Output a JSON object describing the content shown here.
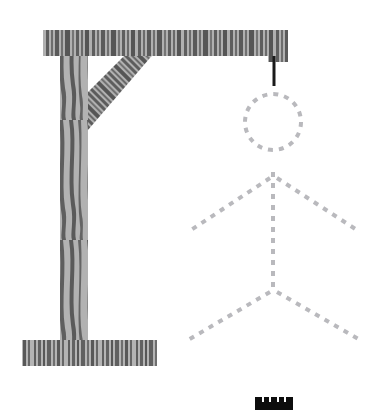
{
  "app": {
    "title": "Hangman",
    "canvas": {
      "width": 381,
      "height": 410,
      "background": "#ffffff"
    }
  },
  "colors": {
    "wood_light": "#b8b8b8",
    "wood_dark": "#5e5e5e",
    "wood_mid": "#8f8f8f",
    "rope": "#1a1a1a",
    "figure_dash": "#b9b9bd",
    "word_bar": "#0d0d0d",
    "word_gap": "#ffffff",
    "background": "#ffffff"
  },
  "gallows": {
    "label": "gallows",
    "parts": [
      {
        "name": "top-beam",
        "x": 43,
        "y": 30,
        "width": 245,
        "height": 26
      },
      {
        "name": "vertical-post",
        "x": 60,
        "y": 30,
        "width": 28,
        "height": 318
      },
      {
        "name": "diagonal-brace",
        "points": "88,48 88,128 160,48"
      },
      {
        "name": "base-plank",
        "x": 22,
        "y": 340,
        "width": 135,
        "height": 26
      }
    ]
  },
  "rope": {
    "name": "rope",
    "x1": 274,
    "y1": 56,
    "x2": 274,
    "y2": 86,
    "stroke_width": 3
  },
  "figure": {
    "label": "hangman-stick-figure",
    "style": "dashed",
    "dash_pattern": "5 6",
    "stroke_width": 4,
    "head": {
      "cx": 273,
      "cy": 122,
      "r": 28
    },
    "body": {
      "x1": 273,
      "y1": 172,
      "x2": 273,
      "y2": 292
    },
    "left_arm": {
      "x1": 270,
      "y1": 178,
      "x2": 188,
      "y2": 232
    },
    "right_arm": {
      "x1": 277,
      "y1": 178,
      "x2": 360,
      "y2": 232
    },
    "left_leg": {
      "x1": 270,
      "y1": 292,
      "x2": 188,
      "y2": 340
    },
    "right_leg": {
      "x1": 277,
      "y1": 292,
      "x2": 360,
      "y2": 340
    }
  },
  "word_display": {
    "name": "word-blanks",
    "x": 255,
    "y": 397,
    "width": 38,
    "height": 13,
    "letter_slots": 5,
    "revealed_letters": [
      "",
      "",
      "",
      "",
      ""
    ]
  },
  "wood_grain": {
    "beam_stripes": [
      {
        "x": 44,
        "w": 3,
        "c": "#5e5e5e"
      },
      {
        "x": 48,
        "w": 2,
        "c": "#9a9a9a"
      },
      {
        "x": 51,
        "w": 5,
        "c": "#5e5e5e"
      },
      {
        "x": 57,
        "w": 3,
        "c": "#b0b0b0"
      },
      {
        "x": 61,
        "w": 2,
        "c": "#5e5e5e"
      },
      {
        "x": 64,
        "w": 4,
        "c": "#a8a8a8"
      },
      {
        "x": 69,
        "w": 6,
        "c": "#5e5e5e"
      },
      {
        "x": 76,
        "w": 3,
        "c": "#b4b4b4"
      },
      {
        "x": 80,
        "w": 2,
        "c": "#5e5e5e"
      },
      {
        "x": 83,
        "w": 5,
        "c": "#a0a0a0"
      },
      {
        "x": 89,
        "w": 3,
        "c": "#5e5e5e"
      },
      {
        "x": 93,
        "w": 7,
        "c": "#b0b0b0"
      },
      {
        "x": 101,
        "w": 2,
        "c": "#5e5e5e"
      },
      {
        "x": 104,
        "w": 3,
        "c": "#9c9c9c"
      },
      {
        "x": 108,
        "w": 4,
        "c": "#5e5e5e"
      },
      {
        "x": 113,
        "w": 2,
        "c": "#b8b8b8"
      },
      {
        "x": 116,
        "w": 3,
        "c": "#5e5e5e"
      },
      {
        "x": 120,
        "w": 5,
        "c": "#a6a6a6"
      },
      {
        "x": 126,
        "w": 2,
        "c": "#5e5e5e"
      },
      {
        "x": 129,
        "w": 4,
        "c": "#b2b2b2"
      },
      {
        "x": 134,
        "w": 3,
        "c": "#5e5e5e"
      },
      {
        "x": 138,
        "w": 6,
        "c": "#9e9e9e"
      },
      {
        "x": 145,
        "w": 2,
        "c": "#5e5e5e"
      },
      {
        "x": 148,
        "w": 3,
        "c": "#b6b6b6"
      },
      {
        "x": 152,
        "w": 5,
        "c": "#5e5e5e"
      },
      {
        "x": 158,
        "w": 3,
        "c": "#a4a4a4"
      },
      {
        "x": 162,
        "w": 2,
        "c": "#5e5e5e"
      },
      {
        "x": 165,
        "w": 4,
        "c": "#b0b0b0"
      },
      {
        "x": 170,
        "w": 3,
        "c": "#5e5e5e"
      },
      {
        "x": 174,
        "w": 2,
        "c": "#9a9a9a"
      },
      {
        "x": 177,
        "w": 6,
        "c": "#5e5e5e"
      },
      {
        "x": 184,
        "w": 3,
        "c": "#b4b4b4"
      },
      {
        "x": 188,
        "w": 2,
        "c": "#5e5e5e"
      },
      {
        "x": 191,
        "w": 5,
        "c": "#a2a2a2"
      },
      {
        "x": 197,
        "w": 3,
        "c": "#5e5e5e"
      },
      {
        "x": 201,
        "w": 4,
        "c": "#b6b6b6"
      },
      {
        "x": 206,
        "w": 2,
        "c": "#5e5e5e"
      },
      {
        "x": 209,
        "w": 3,
        "c": "#9e9e9e"
      },
      {
        "x": 213,
        "w": 5,
        "c": "#5e5e5e"
      },
      {
        "x": 219,
        "w": 2,
        "c": "#b2b2b2"
      },
      {
        "x": 222,
        "w": 4,
        "c": "#5e5e5e"
      },
      {
        "x": 227,
        "w": 3,
        "c": "#a8a8a8"
      },
      {
        "x": 231,
        "w": 2,
        "c": "#5e5e5e"
      },
      {
        "x": 234,
        "w": 5,
        "c": "#b0b0b0"
      },
      {
        "x": 240,
        "w": 3,
        "c": "#5e5e5e"
      },
      {
        "x": 244,
        "w": 2,
        "c": "#9c9c9c"
      },
      {
        "x": 247,
        "w": 6,
        "c": "#5e5e5e"
      },
      {
        "x": 254,
        "w": 3,
        "c": "#b4b4b4"
      },
      {
        "x": 258,
        "w": 2,
        "c": "#5e5e5e"
      },
      {
        "x": 261,
        "w": 4,
        "c": "#a6a6a6"
      },
      {
        "x": 266,
        "w": 3,
        "c": "#5e5e5e"
      },
      {
        "x": 270,
        "w": 5,
        "c": "#b0b0b0"
      },
      {
        "x": 276,
        "w": 3,
        "c": "#5e5e5e"
      },
      {
        "x": 280,
        "w": 2,
        "c": "#9e9e9e"
      },
      {
        "x": 283,
        "w": 5,
        "c": "#5e5e5e"
      }
    ],
    "base_stripes": [
      {
        "x": 23,
        "w": 2,
        "c": "#5e5e5e"
      },
      {
        "x": 26,
        "w": 3,
        "c": "#a8a8a8"
      },
      {
        "x": 30,
        "w": 2,
        "c": "#5e5e5e"
      },
      {
        "x": 33,
        "w": 2,
        "c": "#b4b4b4"
      },
      {
        "x": 36,
        "w": 2,
        "c": "#5e5e5e"
      },
      {
        "x": 39,
        "w": 4,
        "c": "#a0a0a0"
      },
      {
        "x": 44,
        "w": 2,
        "c": "#5e5e5e"
      },
      {
        "x": 47,
        "w": 6,
        "c": "#b6b6b6"
      },
      {
        "x": 54,
        "w": 2,
        "c": "#5e5e5e"
      },
      {
        "x": 57,
        "w": 2,
        "c": "#9e9e9e"
      },
      {
        "x": 60,
        "w": 3,
        "c": "#5e5e5e"
      },
      {
        "x": 64,
        "w": 2,
        "c": "#b2b2b2"
      },
      {
        "x": 67,
        "w": 5,
        "c": "#5e5e5e"
      },
      {
        "x": 73,
        "w": 3,
        "c": "#a6a6a6"
      },
      {
        "x": 77,
        "w": 3,
        "c": "#5e5e5e"
      },
      {
        "x": 81,
        "w": 2,
        "c": "#b0b0b0"
      },
      {
        "x": 84,
        "w": 4,
        "c": "#5e5e5e"
      },
      {
        "x": 89,
        "w": 2,
        "c": "#9c9c9c"
      },
      {
        "x": 92,
        "w": 3,
        "c": "#5e5e5e"
      },
      {
        "x": 96,
        "w": 4,
        "c": "#b4b4b4"
      },
      {
        "x": 101,
        "w": 2,
        "c": "#5e5e5e"
      },
      {
        "x": 104,
        "w": 3,
        "c": "#a2a2a2"
      },
      {
        "x": 108,
        "w": 5,
        "c": "#5e5e5e"
      },
      {
        "x": 114,
        "w": 3,
        "c": "#b6b6b6"
      },
      {
        "x": 118,
        "w": 2,
        "c": "#5e5e5e"
      },
      {
        "x": 121,
        "w": 4,
        "c": "#9e9e9e"
      },
      {
        "x": 126,
        "w": 3,
        "c": "#5e5e5e"
      },
      {
        "x": 130,
        "w": 2,
        "c": "#b2b2b2"
      },
      {
        "x": 133,
        "w": 5,
        "c": "#5e5e5e"
      },
      {
        "x": 139,
        "w": 3,
        "c": "#a8a8a8"
      },
      {
        "x": 143,
        "w": 2,
        "c": "#5e5e5e"
      },
      {
        "x": 146,
        "w": 4,
        "c": "#b0b0b0"
      },
      {
        "x": 151,
        "w": 3,
        "c": "#5e5e5e"
      },
      {
        "x": 155,
        "w": 2,
        "c": "#9c9c9c"
      }
    ],
    "post_stripes": [
      {
        "x": 61,
        "w": 3,
        "c": "#5e5e5e"
      },
      {
        "x": 65,
        "w": 2,
        "c": "#b0b0b0"
      },
      {
        "x": 68,
        "w": 4,
        "c": "#5e5e5e"
      },
      {
        "x": 73,
        "w": 3,
        "c": "#a4a4a4"
      },
      {
        "x": 77,
        "w": 2,
        "c": "#5e5e5e"
      },
      {
        "x": 80,
        "w": 3,
        "c": "#b4b4b4"
      },
      {
        "x": 84,
        "w": 3,
        "c": "#5e5e5e"
      }
    ],
    "brace_stripes": [
      {
        "x": 90,
        "w": 3,
        "c": "#5e5e5e"
      },
      {
        "x": 94,
        "w": 2,
        "c": "#b0b0b0"
      },
      {
        "x": 97,
        "w": 4,
        "c": "#5e5e5e"
      },
      {
        "x": 102,
        "w": 2,
        "c": "#a4a4a4"
      },
      {
        "x": 105,
        "w": 3,
        "c": "#5e5e5e"
      },
      {
        "x": 109,
        "w": 3,
        "c": "#b6b6b6"
      },
      {
        "x": 113,
        "w": 2,
        "c": "#5e5e5e"
      },
      {
        "x": 116,
        "w": 4,
        "c": "#9e9e9e"
      },
      {
        "x": 121,
        "w": 3,
        "c": "#5e5e5e"
      },
      {
        "x": 125,
        "w": 2,
        "c": "#b2b2b2"
      },
      {
        "x": 128,
        "w": 5,
        "c": "#5e5e5e"
      },
      {
        "x": 134,
        "w": 3,
        "c": "#a8a8a8"
      },
      {
        "x": 138,
        "w": 2,
        "c": "#5e5e5e"
      },
      {
        "x": 141,
        "w": 4,
        "c": "#b0b0b0"
      },
      {
        "x": 146,
        "w": 3,
        "c": "#5e5e5e"
      },
      {
        "x": 150,
        "w": 2,
        "c": "#9c9c9c"
      },
      {
        "x": 153,
        "w": 5,
        "c": "#5e5e5e"
      }
    ]
  }
}
